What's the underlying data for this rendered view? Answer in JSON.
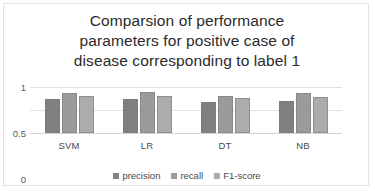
{
  "card": {
    "background": "#ffffff",
    "border_color": "#e3e3e3"
  },
  "chart_data": {
    "type": "bar",
    "title": "Comparsion of performance\nparameters for positive case of\ndisease corresponding to label 1",
    "xlabel": "",
    "ylabel": "",
    "ylim": [
      0,
      1
    ],
    "yticks": [
      "0",
      "0.5",
      "1"
    ],
    "ytick_values": [
      0,
      0.5,
      1
    ],
    "grid": true,
    "legend_position": "bottom",
    "categories": [
      "SVM",
      "LR",
      "DT",
      "NB"
    ],
    "series": [
      {
        "name": "precision",
        "color": "#808080",
        "values": [
          0.75,
          0.75,
          0.68,
          0.7
        ]
      },
      {
        "name": "recall",
        "color": "#9b9b9b",
        "values": [
          0.88,
          0.89,
          0.81,
          0.87
        ]
      },
      {
        "name": "F1-score",
        "color": "#acacac",
        "values": [
          0.8,
          0.81,
          0.76,
          0.78
        ]
      }
    ]
  }
}
